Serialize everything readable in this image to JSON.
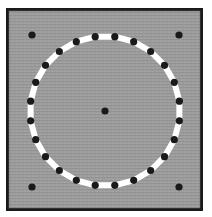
{
  "figure": {
    "type": "geometric-diagram",
    "canvas": {
      "width": 212,
      "height": 217
    },
    "frame": {
      "name": "outer-frame",
      "x": 6,
      "y": 8,
      "width": 197,
      "height": 203,
      "border_width": 3,
      "border_color": "#1a1a1a",
      "fill_color": "#9b9b9b",
      "texture": "horizontal-scanlines",
      "texture_color": "#8e8e8e"
    },
    "polygon": {
      "name": "polygon-ring",
      "sides": 24,
      "center": {
        "x": 105,
        "y": 111
      },
      "radius": 75,
      "rotation_deg": -82.5,
      "stroke_color": "#ffffff",
      "stroke_width": 6,
      "fill": "none",
      "vertex_marker": {
        "shape": "circle",
        "color": "#1a1a1a",
        "radius": 3.6,
        "count": 24
      },
      "vertices": [
        {
          "index": 1,
          "x": 114.8,
          "y": 36.4
        },
        {
          "index": 2,
          "x": 133.1,
          "y": 40.6
        },
        {
          "index": 3,
          "x": 149.4,
          "y": 49.9
        },
        {
          "index": 4,
          "x": 162.3,
          "y": 63.5
        },
        {
          "index": 5,
          "x": 170.7,
          "y": 80.3
        },
        {
          "index": 6,
          "x": 173.9,
          "y": 98.8
        },
        {
          "index": 7,
          "x": 171.7,
          "y": 117.4
        },
        {
          "index": 8,
          "x": 164.2,
          "y": 134.6
        },
        {
          "index": 9,
          "x": 152.1,
          "y": 148.9
        },
        {
          "index": 10,
          "x": 136.4,
          "y": 159.1
        },
        {
          "index": 11,
          "x": 118.5,
          "y": 164.4
        },
        {
          "index": 12,
          "x": 99.7,
          "y": 164.3
        },
        {
          "index": 13,
          "x": 81.8,
          "y": 159.0
        },
        {
          "index": 14,
          "x": 66.1,
          "y": 148.7
        },
        {
          "index": 15,
          "x": 54.1,
          "y": 134.3
        },
        {
          "index": 16,
          "x": 46.7,
          "y": 117.1
        },
        {
          "index": 17,
          "x": 44.6,
          "y": 98.5
        },
        {
          "index": 18,
          "x": 47.9,
          "y": 80.0
        },
        {
          "index": 19,
          "x": 56.4,
          "y": 63.3
        },
        {
          "index": 20,
          "x": 69.4,
          "y": 49.7
        },
        {
          "index": 21,
          "x": 85.7,
          "y": 40.5
        },
        {
          "index": 22,
          "x": 104.0,
          "y": 36.4
        },
        {
          "index": 23,
          "x": 122.4,
          "y": 37.3
        },
        {
          "index": 24,
          "x": 140.0,
          "y": 43.0
        }
      ]
    },
    "center_marker": {
      "name": "center-point",
      "x": 105,
      "y": 111,
      "radius": 3.6,
      "color": "#1a1a1a"
    },
    "corner_markers": {
      "name": "corner-points",
      "radius": 3.6,
      "color": "#1a1a1a",
      "points": [
        {
          "label": "top-left",
          "x": 32,
          "y": 35
        },
        {
          "label": "top-right",
          "x": 179,
          "y": 35
        },
        {
          "label": "bottom-left",
          "x": 32,
          "y": 187
        },
        {
          "label": "bottom-right",
          "x": 179,
          "y": 187
        }
      ]
    }
  }
}
